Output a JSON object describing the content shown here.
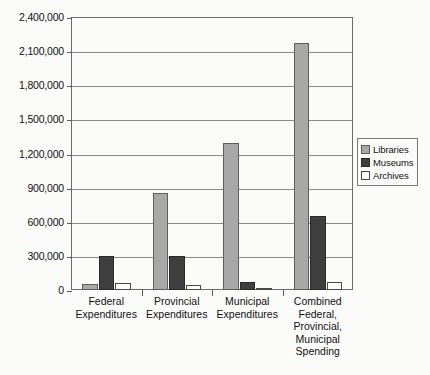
{
  "chart_data": {
    "type": "bar",
    "title": "",
    "subtitle": "",
    "xlabel": "",
    "ylabel": "",
    "grid": true,
    "legend_position": "right",
    "ylim": [
      0,
      2400000
    ],
    "ytick_step": 300000,
    "ytick_labels": [
      "2,400,000",
      "2,100,000",
      "1,800,000",
      "1,500,000",
      "1,200,000",
      "900,000",
      "600,000",
      "300,000",
      "0"
    ],
    "ytick_values": [
      2400000,
      2100000,
      1800000,
      1500000,
      1200000,
      900000,
      600000,
      300000,
      0
    ],
    "categories": [
      "Federal\nExpenditures",
      "Provincial\nExpenditures",
      "Municipal\nExpenditures",
      "Combined\nFederal,\nProvincial,\nMunicipal\nSpending"
    ],
    "series": [
      {
        "name": "Libraries",
        "color": "#a8a8a8",
        "values": [
          50000,
          855000,
          1290000,
          2170000
        ]
      },
      {
        "name": "Museums",
        "color": "#3f3f3f",
        "values": [
          295000,
          300000,
          70000,
          650000
        ]
      },
      {
        "name": "Archives",
        "color": "#fdfdfc",
        "values": [
          60000,
          40000,
          5000,
          70000
        ]
      }
    ]
  },
  "legend": {
    "entries": [
      {
        "label": "Libraries"
      },
      {
        "label": "Museums"
      },
      {
        "label": "Archives"
      }
    ]
  }
}
